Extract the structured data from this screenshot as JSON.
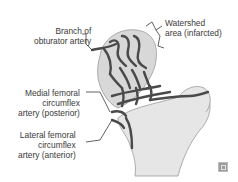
{
  "diagram": {
    "labels": {
      "obturator": [
        "Branch of",
        "obturator artery"
      ],
      "watershed": [
        "Watershed",
        "area (infarcted)"
      ],
      "medial": [
        "Medial femoral",
        "circumflex",
        "artery (posterior)"
      ],
      "lateral": [
        "Lateral femoral",
        "circumflex",
        "artery (anterior)"
      ]
    },
    "colors": {
      "bone_fill": "#e3e3e3",
      "head_fill": "#d6d6d6",
      "vessel": "#4a4a4a",
      "outline": "#9a9a9a",
      "text": "#3a3a3a"
    },
    "logo_icon": "publisher-logo-icon"
  }
}
